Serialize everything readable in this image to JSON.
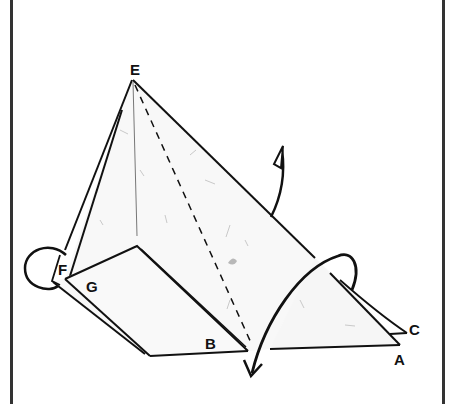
{
  "diagram": {
    "type": "origami-folding-step",
    "labels": {
      "E": "E",
      "F": "F",
      "G": "G",
      "B": "B",
      "A": "A",
      "C": "C"
    },
    "arrows": [
      {
        "name": "mountain-fold-arrow",
        "description": "short curved arrow with hollow triangular head pointing up"
      },
      {
        "name": "flip-over-arrow",
        "description": "large looping arrow near A/C sweeping down-left past B"
      },
      {
        "name": "loop-arrow-left",
        "description": "oval loop around corner F"
      }
    ],
    "fold_lines": [
      {
        "name": "valley-fold-line",
        "style": "dashed",
        "from": "E",
        "to": "bottom near B"
      }
    ],
    "colors": {
      "line": "#111111",
      "paper": "#fafafa",
      "texture": "#c8c8c8",
      "border": "#333333"
    }
  }
}
